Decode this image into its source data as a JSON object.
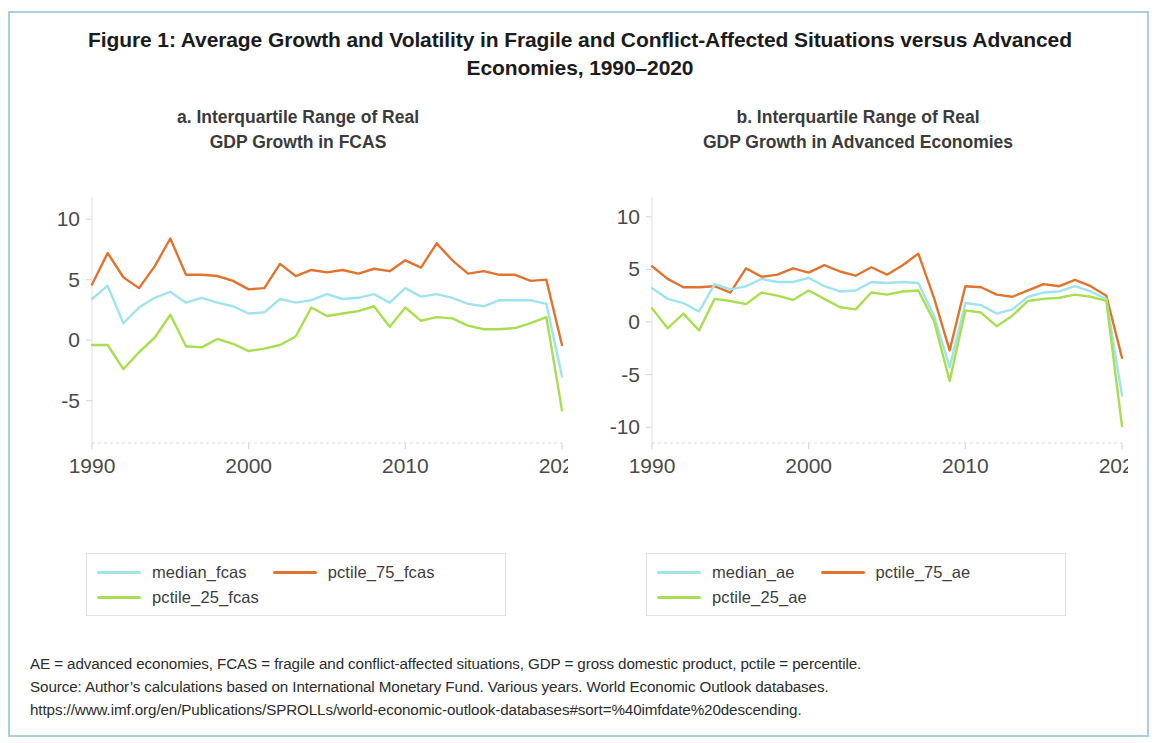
{
  "figure": {
    "title": "Figure 1: Average Growth and Volatility in Fragile and Conflict-Affected Situations versus Advanced Economies, 1990–2020",
    "border_color": "#a8cfe0"
  },
  "colors": {
    "median": "#9fe3ec",
    "pctile_75": "#e0742f",
    "pctile_25": "#a8de4f",
    "axis_text": "#4a4a4a",
    "gridline": "#d9d9d9"
  },
  "notes": {
    "line1": "AE = advanced economies, FCAS = fragile and conflict-affected situations, GDP = gross domestic product, pctile = percentile.",
    "line2": "Source: Author’s calculations based on International Monetary Fund. Various years. World Economic Outlook databases.",
    "line3": "https://www.imf.org/en/Publications/SPROLLs/world-economic-outlook-databases#sort=%40imfdate%20descending."
  },
  "panel_a": {
    "title_line1": "a. Interquartile Range of Real",
    "title_line2": "GDP Growth in FCAS",
    "legend": [
      {
        "label": "median_fcas",
        "color": "#9fe3ec"
      },
      {
        "label": "pctile_75_fcas",
        "color": "#e0742f"
      },
      {
        "label": "pctile_25_fcas",
        "color": "#a8de4f"
      }
    ]
  },
  "panel_b": {
    "title_line1": "b. Interquartile Range of Real",
    "title_line2": "GDP Growth in Advanced Economies",
    "legend": [
      {
        "label": "median_ae",
        "color": "#9fe3ec"
      },
      {
        "label": "pctile_75_ae",
        "color": "#e0742f"
      },
      {
        "label": "pctile_25_ae",
        "color": "#a8de4f"
      }
    ]
  },
  "chart_data": [
    {
      "id": "panel_a",
      "type": "line",
      "title": "a. Interquartile Range of Real GDP Growth in FCAS",
      "xlabel": "",
      "ylabel": "",
      "grid": false,
      "legend_position": "below",
      "xlim": [
        1990,
        2020
      ],
      "ylim": [
        -8.5,
        11.5
      ],
      "xticks": [
        1990,
        2000,
        2010,
        2020
      ],
      "yticks": [
        10,
        5,
        0,
        -5
      ],
      "x": [
        1990,
        1991,
        1992,
        1993,
        1994,
        1995,
        1996,
        1997,
        1998,
        1999,
        2000,
        2001,
        2002,
        2003,
        2004,
        2005,
        2006,
        2007,
        2008,
        2009,
        2010,
        2011,
        2012,
        2013,
        2014,
        2015,
        2016,
        2017,
        2018,
        2019,
        2020
      ],
      "series": [
        {
          "name": "pctile_75_fcas",
          "color": "#e0742f",
          "values": [
            4.6,
            7.2,
            5.2,
            4.3,
            6.1,
            8.4,
            5.4,
            5.4,
            5.3,
            4.9,
            4.2,
            4.3,
            6.3,
            5.3,
            5.8,
            5.6,
            5.8,
            5.5,
            5.9,
            5.7,
            6.6,
            6.0,
            8.0,
            6.6,
            5.5,
            5.7,
            5.4,
            5.4,
            4.9,
            5.0,
            -0.4
          ]
        },
        {
          "name": "median_fcas",
          "color": "#9fe3ec",
          "values": [
            3.4,
            4.5,
            1.4,
            2.7,
            3.5,
            4.0,
            3.1,
            3.5,
            3.1,
            2.8,
            2.2,
            2.3,
            3.4,
            3.1,
            3.3,
            3.8,
            3.4,
            3.5,
            3.8,
            3.1,
            4.3,
            3.6,
            3.8,
            3.5,
            3.0,
            2.8,
            3.3,
            3.3,
            3.3,
            3.0,
            -3.0
          ]
        },
        {
          "name": "pctile_25_fcas",
          "color": "#a8de4f",
          "values": [
            -0.4,
            -0.4,
            -2.4,
            -1.0,
            0.2,
            2.1,
            -0.5,
            -0.6,
            0.1,
            -0.3,
            -0.9,
            -0.7,
            -0.4,
            0.3,
            2.7,
            2.0,
            2.2,
            2.4,
            2.8,
            1.1,
            2.7,
            1.6,
            1.9,
            1.8,
            1.2,
            0.9,
            0.9,
            1.0,
            1.4,
            1.9,
            -5.8
          ]
        }
      ]
    },
    {
      "id": "panel_b",
      "type": "line",
      "title": "b. Interquartile Range of Real GDP Growth in Advanced Economies",
      "xlabel": "",
      "ylabel": "",
      "grid": false,
      "legend_position": "below",
      "xlim": [
        1990,
        2020
      ],
      "ylim": [
        -11.5,
        11.5
      ],
      "xticks": [
        1990,
        2000,
        2010,
        2020
      ],
      "yticks": [
        10,
        5,
        0,
        -5,
        -10
      ],
      "x": [
        1990,
        1991,
        1992,
        1993,
        1994,
        1995,
        1996,
        1997,
        1998,
        1999,
        2000,
        2001,
        2002,
        2003,
        2004,
        2005,
        2006,
        2007,
        2008,
        2009,
        2010,
        2011,
        2012,
        2013,
        2014,
        2015,
        2016,
        2017,
        2018,
        2019,
        2020
      ],
      "series": [
        {
          "name": "pctile_75_ae",
          "color": "#e0742f",
          "values": [
            5.3,
            4.1,
            3.3,
            3.3,
            3.4,
            2.8,
            5.1,
            4.3,
            4.5,
            5.1,
            4.7,
            5.4,
            4.8,
            4.4,
            5.2,
            4.5,
            5.4,
            6.5,
            2.3,
            -2.7,
            3.4,
            3.3,
            2.6,
            2.4,
            3.0,
            3.6,
            3.4,
            4.0,
            3.4,
            2.5,
            -3.4
          ]
        },
        {
          "name": "median_ae",
          "color": "#9fe3ec",
          "values": [
            3.2,
            2.2,
            1.8,
            1.0,
            3.6,
            3.1,
            3.4,
            4.1,
            3.8,
            3.8,
            4.2,
            3.4,
            2.9,
            3.0,
            3.8,
            3.7,
            3.8,
            3.7,
            0.6,
            -4.3,
            1.8,
            1.6,
            0.8,
            1.2,
            2.4,
            2.8,
            2.9,
            3.4,
            2.9,
            2.2,
            -7.0
          ]
        },
        {
          "name": "pctile_25_ae",
          "color": "#a8de4f",
          "values": [
            1.3,
            -0.6,
            0.8,
            -0.8,
            2.2,
            2.0,
            1.7,
            2.8,
            2.5,
            2.1,
            3.0,
            2.2,
            1.4,
            1.2,
            2.8,
            2.6,
            2.9,
            3.0,
            0.1,
            -5.6,
            1.1,
            0.9,
            -0.4,
            0.6,
            2.0,
            2.2,
            2.3,
            2.6,
            2.4,
            2.0,
            -9.9
          ]
        }
      ]
    }
  ]
}
